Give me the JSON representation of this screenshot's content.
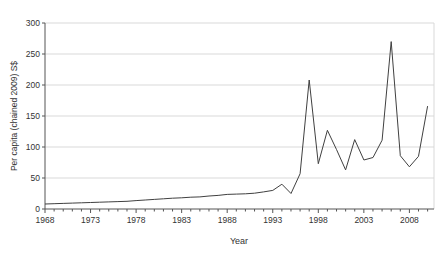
{
  "chart_data": {
    "type": "line",
    "x": [
      1968,
      1969,
      1970,
      1971,
      1972,
      1973,
      1974,
      1975,
      1976,
      1977,
      1978,
      1979,
      1980,
      1981,
      1982,
      1983,
      1984,
      1985,
      1986,
      1987,
      1988,
      1989,
      1990,
      1991,
      1992,
      1993,
      1994,
      1995,
      1996,
      1997,
      1998,
      1999,
      2000,
      2001,
      2002,
      2003,
      2004,
      2005,
      2006,
      2007,
      2008,
      2009,
      2010
    ],
    "values": [
      8,
      8.5,
      9,
      9.5,
      10,
      10.5,
      11,
      11.5,
      12,
      12.5,
      13.5,
      14.5,
      15.5,
      16.5,
      17.5,
      18,
      19,
      19.5,
      21,
      22,
      23.5,
      24,
      24.5,
      25.5,
      27.5,
      30,
      40,
      25,
      57,
      208,
      73,
      127,
      96,
      63,
      112,
      79,
      83,
      111,
      270,
      86,
      68,
      85,
      166
    ],
    "title": "",
    "xlabel": "Year",
    "ylabel": "Per capita (chained 2009) S$",
    "xlim": [
      1968,
      2010.7
    ],
    "ylim": [
      0,
      300
    ],
    "yticks": [
      0,
      50,
      100,
      150,
      200,
      250,
      300
    ],
    "xticks": [
      1968,
      1973,
      1978,
      1983,
      1988,
      1993,
      1998,
      2003,
      2008
    ],
    "x_minor_tick_step": 1,
    "grid": true,
    "legend": "none",
    "line_color": "#404040",
    "grid_color": "#d9d9d9",
    "axis_color": "#555555",
    "text_color": "#333333",
    "background_color": "#ffffff"
  }
}
